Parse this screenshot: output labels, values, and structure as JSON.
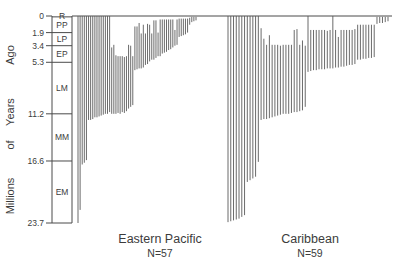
{
  "chart_data": {
    "type": "bar",
    "title": "",
    "orientation": "vertical-ranges",
    "ylabel": "Millions of Years Ago",
    "xlabel": "",
    "ylim": [
      0,
      23.7
    ],
    "y_axis_reversed": true,
    "grid": false,
    "legend": "none",
    "axis_note": "Time axis runs downward: 0 Ma at top, 23.7 Ma at bottom. Each vertical line is the stratigraphic range of one species.",
    "y_ticks": [
      {
        "value": 0,
        "label": "0"
      },
      {
        "value": 1.9,
        "label": "1.9"
      },
      {
        "value": 3.4,
        "label": "3.4"
      },
      {
        "value": 5.3,
        "label": "5.3"
      },
      {
        "value": 11.2,
        "label": "11.2"
      },
      {
        "value": 16.6,
        "label": "16.6"
      },
      {
        "value": 23.7,
        "label": "23.7"
      }
    ],
    "epochs": [
      {
        "code": "R",
        "top": 0.0,
        "bottom": 0.1
      },
      {
        "code": "PP",
        "top": 0.1,
        "bottom": 1.9
      },
      {
        "code": "LP",
        "top": 1.9,
        "bottom": 3.4
      },
      {
        "code": "EP",
        "top": 3.4,
        "bottom": 5.3
      },
      {
        "code": "LM",
        "top": 5.3,
        "bottom": 11.2
      },
      {
        "code": "MM",
        "top": 11.2,
        "bottom": 16.6
      },
      {
        "code": "EM",
        "top": 16.6,
        "bottom": 23.7
      }
    ],
    "ylabel_words": [
      "Millions",
      "of",
      "Years",
      "Ago"
    ],
    "series": [
      {
        "name": "Eastern Pacific",
        "n_label": "N=57",
        "count": 57,
        "ranges": [
          [
            0.0,
            23.7
          ],
          [
            0.0,
            22.2
          ],
          [
            0.0,
            17.0
          ],
          [
            0.0,
            16.8
          ],
          [
            0.0,
            16.5
          ],
          [
            0.0,
            11.9
          ],
          [
            0.0,
            11.9
          ],
          [
            0.0,
            11.8
          ],
          [
            0.0,
            11.6
          ],
          [
            0.0,
            11.6
          ],
          [
            0.0,
            11.5
          ],
          [
            0.0,
            11.4
          ],
          [
            0.0,
            11.3
          ],
          [
            0.0,
            11.2
          ],
          [
            0.0,
            11.2
          ],
          [
            0.0,
            11.0
          ],
          [
            3.6,
            11.2
          ],
          [
            3.3,
            11.2
          ],
          [
            4.5,
            11.2
          ],
          [
            4.6,
            11.1
          ],
          [
            4.6,
            11.2
          ],
          [
            4.6,
            11.0
          ],
          [
            4.7,
            11.1
          ],
          [
            4.6,
            10.9
          ],
          [
            3.3,
            10.6
          ],
          [
            3.4,
            10.4
          ],
          [
            4.6,
            10.2
          ],
          [
            1.2,
            6.2
          ],
          [
            1.2,
            6.1
          ],
          [
            0.8,
            6.0
          ],
          [
            2.0,
            6.0
          ],
          [
            1.0,
            5.9
          ],
          [
            2.0,
            5.6
          ],
          [
            0.9,
            5.5
          ],
          [
            1.0,
            5.2
          ],
          [
            2.0,
            5.0
          ],
          [
            0.5,
            5.0
          ],
          [
            0.5,
            4.8
          ],
          [
            1.9,
            4.6
          ],
          [
            0.4,
            4.6
          ],
          [
            0.4,
            4.3
          ],
          [
            0.4,
            4.2
          ],
          [
            0.4,
            4.1
          ],
          [
            0.4,
            3.9
          ],
          [
            0.4,
            3.8
          ],
          [
            0.4,
            3.6
          ],
          [
            1.6,
            3.4
          ],
          [
            0.4,
            3.3
          ],
          [
            0.3,
            2.4
          ],
          [
            0.3,
            2.3
          ],
          [
            0.3,
            2.2
          ],
          [
            0.3,
            2.1
          ],
          [
            0.3,
            1.9
          ],
          [
            0.2,
            1.0
          ],
          [
            0.1,
            0.7
          ],
          [
            0.1,
            0.6
          ],
          [
            0.1,
            0.5
          ]
        ]
      },
      {
        "name": "Caribbean",
        "n_label": "N=59",
        "count": 59,
        "ranges": [
          [
            0.0,
            23.6
          ],
          [
            0.0,
            23.5
          ],
          [
            0.0,
            23.4
          ],
          [
            0.0,
            23.3
          ],
          [
            0.0,
            23.2
          ],
          [
            0.0,
            23.0
          ],
          [
            0.0,
            22.8
          ],
          [
            0.0,
            19.0
          ],
          [
            0.0,
            18.8
          ],
          [
            0.0,
            18.6
          ],
          [
            0.0,
            18.4
          ],
          [
            0.0,
            16.7
          ],
          [
            1.4,
            11.9
          ],
          [
            2.6,
            11.8
          ],
          [
            3.3,
            11.8
          ],
          [
            2.2,
            11.7
          ],
          [
            3.3,
            11.6
          ],
          [
            3.3,
            11.5
          ],
          [
            3.3,
            11.4
          ],
          [
            3.4,
            11.3
          ],
          [
            3.3,
            11.2
          ],
          [
            3.3,
            11.2
          ],
          [
            3.3,
            11.2
          ],
          [
            3.3,
            11.1
          ],
          [
            1.6,
            11.0
          ],
          [
            1.5,
            11.0
          ],
          [
            3.3,
            10.9
          ],
          [
            2.8,
            10.8
          ],
          [
            3.4,
            10.4
          ],
          [
            0.0,
            6.4
          ],
          [
            1.6,
            6.3
          ],
          [
            1.6,
            6.2
          ],
          [
            1.6,
            6.2
          ],
          [
            1.6,
            6.1
          ],
          [
            1.6,
            6.1
          ],
          [
            1.6,
            6.1
          ],
          [
            1.7,
            6.0
          ],
          [
            1.6,
            6.0
          ],
          [
            0.0,
            6.0
          ],
          [
            1.6,
            5.9
          ],
          [
            2.4,
            5.9
          ],
          [
            1.6,
            5.8
          ],
          [
            1.6,
            5.8
          ],
          [
            1.6,
            5.7
          ],
          [
            1.6,
            5.6
          ],
          [
            1.6,
            5.6
          ],
          [
            1.5,
            5.5
          ],
          [
            1.0,
            5.0
          ],
          [
            1.0,
            5.0
          ],
          [
            1.0,
            4.9
          ],
          [
            1.0,
            4.9
          ],
          [
            1.0,
            4.8
          ],
          [
            1.0,
            4.8
          ],
          [
            1.0,
            4.7
          ],
          [
            0.1,
            0.9
          ],
          [
            0.1,
            0.8
          ],
          [
            0.1,
            0.8
          ],
          [
            0.1,
            0.7
          ],
          [
            0.1,
            0.6
          ]
        ]
      }
    ]
  }
}
